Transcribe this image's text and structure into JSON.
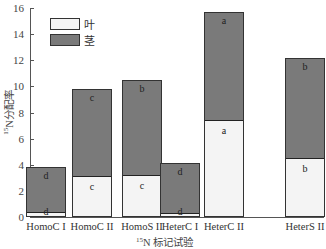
{
  "chart_data": {
    "type": "bar",
    "stacked": true,
    "title": "",
    "xlabel": "15N 标记试验",
    "xlabel_superscript": "15",
    "xlabel_rest": "N 标记试验",
    "ylabel": "15N分配率",
    "ylabel_superscript": "15",
    "ylabel_rest": "N分配率",
    "ylim": [
      0,
      16
    ],
    "yticks": [
      0,
      2,
      4,
      6,
      8,
      10,
      12,
      14,
      16
    ],
    "grid": false,
    "legend_position": "upper-left",
    "categories": [
      "HomoC I",
      "HomoC II",
      "HomoS II",
      "HeterC I",
      "HeterC II",
      "HeterS II"
    ],
    "series": [
      {
        "name": "叶",
        "color": "#f4f4f4",
        "values": [
          0.2,
          3.0,
          3.1,
          0.15,
          7.3,
          4.4
        ],
        "significance": [
          "d",
          "c",
          "c",
          "d",
          "a",
          "b"
        ]
      },
      {
        "name": "茎",
        "color": "#7a7a7a",
        "values": [
          3.6,
          6.8,
          7.4,
          3.95,
          8.4,
          7.8
        ],
        "significance": [
          "d",
          "c",
          "b",
          "d",
          "a",
          "b"
        ]
      }
    ],
    "totals": [
      3.8,
      9.8,
      10.5,
      4.1,
      15.7,
      12.2
    ]
  },
  "legend": {
    "items": [
      {
        "label": "叶",
        "color": "#f4f4f4"
      },
      {
        "label": "茎",
        "color": "#7a7a7a"
      }
    ]
  }
}
